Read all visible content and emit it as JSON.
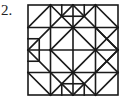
{
  "problem": {
    "label": "2."
  },
  "figure": {
    "frame": {
      "x": 28,
      "y": 5,
      "size": 90
    },
    "grid_divisions": 4,
    "stroke_color": "#1a1a1a"
  }
}
